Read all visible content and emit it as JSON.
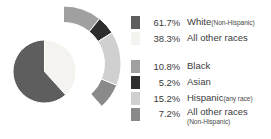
{
  "chart_data": {
    "type": "pie",
    "title": "",
    "subtitle": "",
    "xlabel": "",
    "ylabel": "",
    "legend_position": "right",
    "grid": false,
    "inner_ring": {
      "name": "Top level",
      "categories": [
        "White (Non-Hispanic)",
        "All other races"
      ],
      "values": [
        61.7,
        38.3
      ],
      "colors": [
        "#5e5e5e",
        "#f4f3ef"
      ]
    },
    "outer_ring": {
      "name": "All other races breakdown",
      "categories": [
        "Black",
        "Asian",
        "Hispanic (any race)",
        "All other races (Non-Hispanic)"
      ],
      "values": [
        10.8,
        5.2,
        15.2,
        7.2
      ],
      "colors": [
        "#a0a0a0",
        "#2e2e2e",
        "#d0d0d0",
        "#8a8a8a"
      ]
    },
    "units": "percent"
  },
  "legend": {
    "main_group": [
      {
        "swatch_color": "#5e5e5e",
        "percent": "61.7%",
        "label": "White",
        "note": "(Non-Hispanic)"
      },
      {
        "swatch_color": "#f4f3ef",
        "percent": "38.3%",
        "label": "All other races",
        "note": ""
      }
    ],
    "detail_group": [
      {
        "swatch_color": "#a0a0a0",
        "percent": "10.8%",
        "label": "Black",
        "note": ""
      },
      {
        "swatch_color": "#2e2e2e",
        "percent": "5.2%",
        "label": "Asian",
        "note": ""
      },
      {
        "swatch_color": "#d0d0d0",
        "percent": "15.2%",
        "label": "Hispanic",
        "note": "(any race)"
      },
      {
        "swatch_color": "#8a8a8a",
        "percent": "7.2%",
        "label": "All other races",
        "note": "(Non-Hispanic)"
      }
    ]
  }
}
